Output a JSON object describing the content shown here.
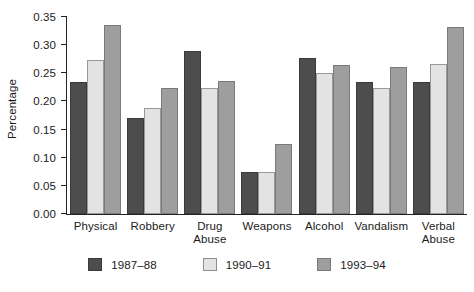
{
  "chart_data": {
    "type": "bar",
    "title": "",
    "subtitle": "",
    "xlabel": "",
    "ylabel": "Percentage",
    "ylim": [
      0,
      0.35
    ],
    "yticks": [
      "0.00",
      "0.05",
      "0.10",
      "0.15",
      "0.20",
      "0.25",
      "0.30",
      "0.35"
    ],
    "ytick_values": [
      0.0,
      0.05,
      0.1,
      0.15,
      0.2,
      0.25,
      0.3,
      0.35
    ],
    "grid": false,
    "legend_position": "bottom",
    "categories": [
      "Physical",
      "Robbery",
      "Drug\nAbuse",
      "Weapons",
      "Alcohol",
      "Vandalism",
      "Verbal\nAbuse"
    ],
    "series": [
      {
        "name": "1987–88",
        "color": "#4d4d4d",
        "values": [
          0.235,
          0.17,
          0.29,
          0.075,
          0.278,
          0.234,
          0.234
        ]
      },
      {
        "name": "1990–91",
        "color": "#e3e3e3",
        "values": [
          0.274,
          0.188,
          0.224,
          0.075,
          0.25,
          0.223,
          0.267
        ]
      },
      {
        "name": "1993–94",
        "color": "#9e9e9e",
        "values": [
          0.336,
          0.224,
          0.236,
          0.125,
          0.265,
          0.262,
          0.333
        ]
      }
    ]
  }
}
